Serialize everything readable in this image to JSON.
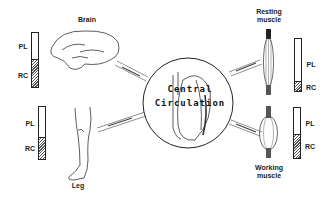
{
  "center": {
    "line1": "Central",
    "line2": "Circulation"
  },
  "bar_labels": {
    "top": "PL",
    "bottom": "RC"
  },
  "organs": {
    "brain": {
      "label": "Brain",
      "rc_fraction": 0.48
    },
    "leg": {
      "label": "Leg",
      "rc_fraction": 0.36
    },
    "resting_muscle": {
      "label_line1": "Resting",
      "label_line2": "muscle",
      "rc_fraction": 0.18
    },
    "working_muscle": {
      "label_line1": "Working",
      "label_line2": "muscle",
      "rc_fraction": 0.55
    }
  }
}
